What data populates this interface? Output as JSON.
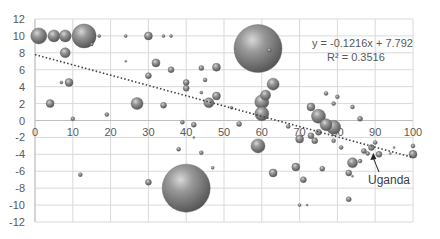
{
  "chart_data": {
    "type": "bubble",
    "title": "",
    "xlabel": "",
    "ylabel": "",
    "xlim": [
      0,
      100
    ],
    "ylim": [
      -12,
      12
    ],
    "x_ticks": [
      0,
      10,
      20,
      30,
      40,
      50,
      60,
      70,
      80,
      90,
      100
    ],
    "y_ticks": [
      12,
      10,
      8,
      6,
      4,
      2,
      0,
      -2,
      -4,
      -6,
      -8,
      -10,
      -12
    ],
    "grid": true,
    "legend": null,
    "bubble_color": "#7f7f7f",
    "points": [
      {
        "x": 1,
        "y": 10,
        "r": 8
      },
      {
        "x": 5,
        "y": 10,
        "r": 6
      },
      {
        "x": 8,
        "y": 10,
        "r": 6
      },
      {
        "x": 13,
        "y": 10,
        "r": 12
      },
      {
        "x": 17,
        "y": 10,
        "r": 1.5
      },
      {
        "x": 24,
        "y": 10,
        "r": 1.5
      },
      {
        "x": 30,
        "y": 10,
        "r": 4
      },
      {
        "x": 34,
        "y": 10,
        "r": 1.5
      },
      {
        "x": 36,
        "y": 10,
        "r": 1.5
      },
      {
        "x": 15,
        "y": 9,
        "r": 1.5
      },
      {
        "x": 8,
        "y": 8,
        "r": 5
      },
      {
        "x": 24,
        "y": 7,
        "r": 1
      },
      {
        "x": 9,
        "y": 4.5,
        "r": 4
      },
      {
        "x": 7,
        "y": 4.5,
        "r": 1.5
      },
      {
        "x": 4,
        "y": 2,
        "r": 4
      },
      {
        "x": 27,
        "y": 2,
        "r": 6
      },
      {
        "x": 10,
        "y": 0.2,
        "r": 2
      },
      {
        "x": 19,
        "y": 0.7,
        "r": 2
      },
      {
        "x": 12,
        "y": -6.4,
        "r": 2
      },
      {
        "x": 30,
        "y": 5.3,
        "r": 3
      },
      {
        "x": 32,
        "y": 6.8,
        "r": 4
      },
      {
        "x": 36,
        "y": 6,
        "r": 3
      },
      {
        "x": 34,
        "y": 1.8,
        "r": 3
      },
      {
        "x": 40,
        "y": 4.5,
        "r": 3
      },
      {
        "x": 40,
        "y": 3.8,
        "r": 3
      },
      {
        "x": 44,
        "y": 6.2,
        "r": 2.5
      },
      {
        "x": 45,
        "y": 4.8,
        "r": 2
      },
      {
        "x": 44,
        "y": 3.3,
        "r": 1.5
      },
      {
        "x": 48,
        "y": 6.3,
        "r": 4
      },
      {
        "x": 48,
        "y": 2.9,
        "r": 4
      },
      {
        "x": 46,
        "y": 2.1,
        "r": 5
      },
      {
        "x": 52,
        "y": 1.5,
        "r": 1.5
      },
      {
        "x": 59,
        "y": 8.5,
        "r": 24
      },
      {
        "x": 62,
        "y": 8.3,
        "r": 2
      },
      {
        "x": 63,
        "y": 4.3,
        "r": 6
      },
      {
        "x": 61,
        "y": 3,
        "r": 5
      },
      {
        "x": 60,
        "y": 2.2,
        "r": 7
      },
      {
        "x": 60,
        "y": 0.8,
        "r": 7
      },
      {
        "x": 40,
        "y": -8,
        "r": 24
      },
      {
        "x": 39,
        "y": -0.2,
        "r": 2
      },
      {
        "x": 42,
        "y": -0.5,
        "r": 2.5
      },
      {
        "x": 42,
        "y": -2,
        "r": 1
      },
      {
        "x": 38,
        "y": -3.4,
        "r": 2
      },
      {
        "x": 44,
        "y": -3.8,
        "r": 2
      },
      {
        "x": 30,
        "y": -7.3,
        "r": 3
      },
      {
        "x": 47,
        "y": -5.6,
        "r": 1.5
      },
      {
        "x": 59,
        "y": -3,
        "r": 7
      },
      {
        "x": 54,
        "y": -0.4,
        "r": 2.5
      },
      {
        "x": 67,
        "y": -0.7,
        "r": 2
      },
      {
        "x": 70,
        "y": -2.2,
        "r": 4
      },
      {
        "x": 73,
        "y": -1.8,
        "r": 3
      },
      {
        "x": 63,
        "y": -6.2,
        "r": 4
      },
      {
        "x": 69,
        "y": -5.5,
        "r": 4
      },
      {
        "x": 71,
        "y": -7,
        "r": 3
      },
      {
        "x": 70,
        "y": -10,
        "r": 1.5
      },
      {
        "x": 73,
        "y": 1.6,
        "r": 4
      },
      {
        "x": 75,
        "y": 0.5,
        "r": 7
      },
      {
        "x": 77,
        "y": 3.2,
        "r": 2
      },
      {
        "x": 79,
        "y": 2,
        "r": 2
      },
      {
        "x": 80,
        "y": 2.8,
        "r": 2
      },
      {
        "x": 84,
        "y": 1.6,
        "r": 2
      },
      {
        "x": 86,
        "y": 0.2,
        "r": 2.5
      },
      {
        "x": 77,
        "y": -0.5,
        "r": 6
      },
      {
        "x": 79,
        "y": -0.8,
        "r": 7
      },
      {
        "x": 75,
        "y": -1.4,
        "r": 3
      },
      {
        "x": 74,
        "y": -2.4,
        "r": 3
      },
      {
        "x": 79,
        "y": -2.4,
        "r": 2
      },
      {
        "x": 81,
        "y": -3.2,
        "r": 2
      },
      {
        "x": 76,
        "y": -5.7,
        "r": 2.5
      },
      {
        "x": 84,
        "y": -5,
        "r": 5
      },
      {
        "x": 83,
        "y": -6.2,
        "r": 3
      },
      {
        "x": 86,
        "y": -4.8,
        "r": 2
      },
      {
        "x": 84,
        "y": -6.6,
        "r": 1
      },
      {
        "x": 83,
        "y": -9.3,
        "r": 2.5
      },
      {
        "x": 87,
        "y": -3.6,
        "r": 2.5
      },
      {
        "x": 89,
        "y": -3.2,
        "r": 3
      },
      {
        "x": 88,
        "y": -3.9,
        "r": 2
      },
      {
        "x": 91,
        "y": -4,
        "r": 3
      },
      {
        "x": 94,
        "y": -3.9,
        "r": 1
      },
      {
        "x": 90,
        "y": -2.6,
        "r": 2
      },
      {
        "x": 95,
        "y": -3.2,
        "r": 1
      },
      {
        "x": 100,
        "y": -4,
        "r": 4
      },
      {
        "x": 100,
        "y": -3,
        "r": 2
      },
      {
        "x": 72,
        "y": -10,
        "r": 1
      }
    ],
    "trendline": {
      "type": "linear",
      "slope": -0.1216,
      "intercept": 7.792,
      "equation_label": "y = -0.1216x + 7.792",
      "r2_label": "R² = 0.3516",
      "style": "dotted",
      "color": "#404040"
    },
    "annotations": [
      {
        "text": "Uganda",
        "x": 89.5,
        "y": -3.6,
        "label_x": 91,
        "label_y": -7.5
      }
    ]
  }
}
